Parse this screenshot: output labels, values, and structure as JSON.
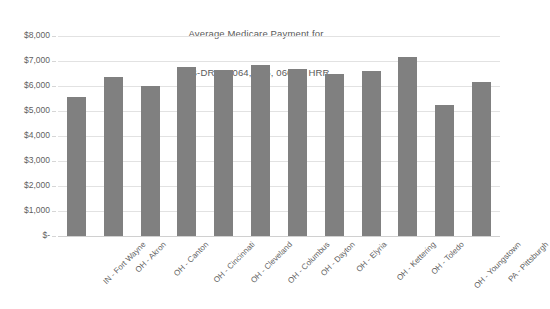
{
  "chart_data": {
    "type": "bar",
    "title": "Average Medicare Payment for MS-DRGs  064, 065, 066 by HRR",
    "title_line1": "Average Medicare Payment for",
    "title_line2": "MS-DRGs  064, 065, 066 by HRR",
    "subtitle": "",
    "xlabel": "",
    "ylabel": "",
    "ylim": [
      0,
      8000
    ],
    "grid": true,
    "legend": "none",
    "bar_color": "#808080",
    "gridline_color": "#e2e2e2",
    "text_color": "#5f5f5f",
    "categories": [
      "IN - Fort Wayne",
      "OH - Akron",
      "OH - Canton",
      "OH - Cincinnati",
      "OH - Cleveland",
      "OH - Columbus",
      "OH - Dayton",
      "OH - Elyria",
      "OH - Kettering",
      "OH - Toledo",
      "OH - Youngstown",
      "PA - Pittsburgh"
    ],
    "values": [
      5550,
      6350,
      6000,
      6750,
      6650,
      6850,
      6700,
      6500,
      6600,
      7150,
      5250,
      6150
    ],
    "ytick_values": [
      8000,
      7000,
      6000,
      5000,
      4000,
      3000,
      2000,
      1000,
      0
    ],
    "ytick_labels": [
      "$8,000",
      "$7,000",
      "$6,000",
      "$5,000",
      "$4,000",
      "$3,000",
      "$2,000",
      "$1,000",
      "$-"
    ]
  },
  "footer": {
    "cut_text": ""
  }
}
